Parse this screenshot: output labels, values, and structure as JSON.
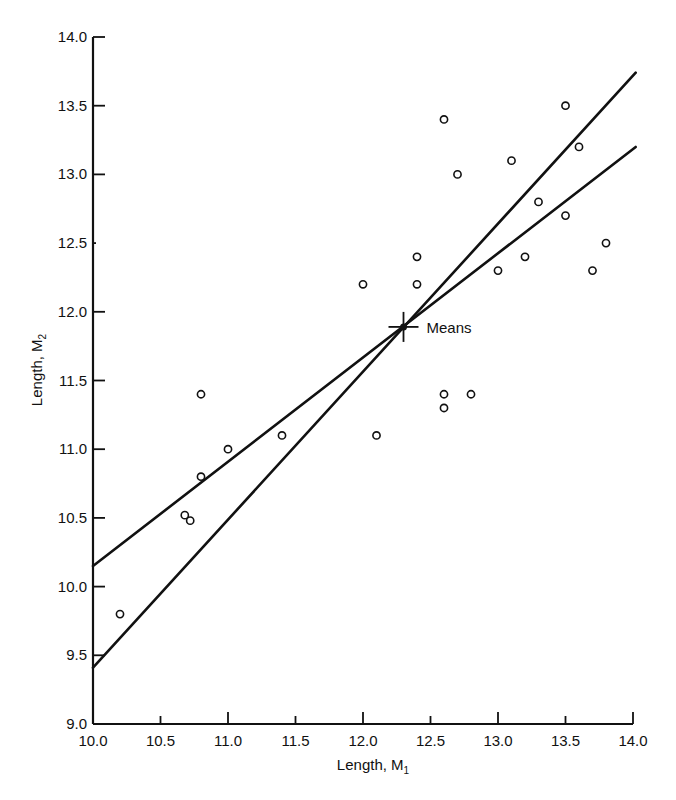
{
  "chart_data": {
    "type": "scatter",
    "title": "",
    "xlabel": "Length, M",
    "xlabel_sub": "1",
    "ylabel": "Length, M",
    "ylabel_sub": "2",
    "xlim": [
      10.0,
      14.0
    ],
    "ylim": [
      9.0,
      14.0
    ],
    "x_ticks": [
      "10.0",
      "10.5",
      "11.0",
      "11.5",
      "12.0",
      "12.5",
      "13.0",
      "13.5",
      "14.0"
    ],
    "y_ticks": [
      "9.0",
      "9.5",
      "10.0",
      "10.5",
      "11.0",
      "11.5",
      "12.0",
      "12.5",
      "13.0",
      "13.5",
      "14.0"
    ],
    "grid": false,
    "legend": null,
    "series": [
      {
        "name": "observations",
        "marker": "open-circle",
        "points": [
          {
            "x": 10.2,
            "y": 9.8
          },
          {
            "x": 10.68,
            "y": 10.52
          },
          {
            "x": 10.72,
            "y": 10.48
          },
          {
            "x": 10.8,
            "y": 10.8
          },
          {
            "x": 10.8,
            "y": 11.4
          },
          {
            "x": 11.0,
            "y": 11.0
          },
          {
            "x": 11.4,
            "y": 11.1
          },
          {
            "x": 12.0,
            "y": 12.2
          },
          {
            "x": 12.1,
            "y": 11.1
          },
          {
            "x": 12.4,
            "y": 12.2
          },
          {
            "x": 12.4,
            "y": 12.4
          },
          {
            "x": 12.6,
            "y": 11.3
          },
          {
            "x": 12.6,
            "y": 11.4
          },
          {
            "x": 12.8,
            "y": 11.4
          },
          {
            "x": 12.6,
            "y": 13.4
          },
          {
            "x": 12.7,
            "y": 13.0
          },
          {
            "x": 13.0,
            "y": 12.3
          },
          {
            "x": 13.1,
            "y": 13.1
          },
          {
            "x": 13.2,
            "y": 12.4
          },
          {
            "x": 13.3,
            "y": 12.8
          },
          {
            "x": 13.5,
            "y": 12.7
          },
          {
            "x": 13.5,
            "y": 13.5
          },
          {
            "x": 13.6,
            "y": 13.2
          },
          {
            "x": 13.7,
            "y": 12.3
          },
          {
            "x": 13.8,
            "y": 12.5
          }
        ]
      }
    ],
    "lines": [
      {
        "name": "regression-line-shallow",
        "x1": 10.0,
        "y1": 10.15,
        "x2": 14.02,
        "y2": 13.2
      },
      {
        "name": "regression-line-steep",
        "x1": 10.0,
        "y1": 9.41,
        "x2": 14.02,
        "y2": 13.74
      }
    ],
    "annotations": [
      {
        "text": "Means",
        "x": 12.3,
        "y": 11.89,
        "marker": "cross"
      }
    ]
  }
}
